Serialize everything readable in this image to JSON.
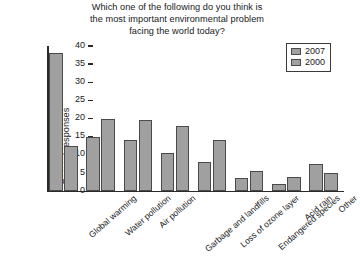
{
  "chart_data": {
    "type": "bar",
    "title": "Which one of the following do you think is the most important environmental problem facing the world today?",
    "title_lines": [
      "Which one of the following do you think is",
      "the most important environmental problem",
      "facing the world today?"
    ],
    "xlabel": "",
    "ylabel": "Percent responses",
    "ylim": [
      0,
      40
    ],
    "yticks": [
      0,
      5,
      10,
      15,
      20,
      25,
      30,
      35,
      40
    ],
    "ytick_labels": [
      "0",
      "5",
      "10",
      "15",
      "20",
      "25",
      "30",
      "35",
      "40"
    ],
    "grid": false,
    "legend_position": "top-right",
    "categories": [
      "Global warming",
      "Water pollution",
      "Air pollution",
      "Garbage and landfills",
      "Loss of ozone layer",
      "Endangered species",
      "Acid rain",
      "Other"
    ],
    "series": [
      {
        "name": "2007",
        "color": "#a0a0a0",
        "values": [
          38,
          15,
          14,
          10.5,
          8,
          3.5,
          2,
          7.5
        ]
      },
      {
        "name": "2000",
        "color": "#a0a0a0",
        "values": [
          12.5,
          20,
          19.5,
          18,
          14,
          5.5,
          4,
          5
        ]
      }
    ]
  },
  "legend": {
    "entries": [
      {
        "label": "2007",
        "swatch": "#a0a0a0"
      },
      {
        "label": "2000",
        "swatch": "#a0a0a0"
      }
    ]
  },
  "colors": {
    "bar_fill": "#a0a0a0",
    "bar_stroke": "#4a4a4a",
    "axis": "#2a2a2a",
    "text": "#17191a",
    "background": "#ffffff"
  }
}
